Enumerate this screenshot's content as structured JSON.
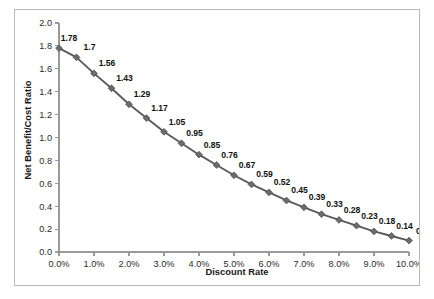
{
  "chart_data": {
    "type": "line",
    "title": "",
    "xlabel": "Discount Rate",
    "ylabel": "Net Benefit/Cost Ratio",
    "x": [
      0.0,
      0.5,
      1.0,
      1.5,
      2.0,
      2.5,
      3.0,
      3.5,
      4.0,
      4.5,
      5.0,
      5.5,
      6.0,
      6.5,
      7.0,
      7.5,
      8.0,
      8.5,
      9.0,
      9.5,
      10.0
    ],
    "values": [
      1.78,
      1.7,
      1.56,
      1.43,
      1.29,
      1.17,
      1.05,
      0.95,
      0.85,
      0.76,
      0.67,
      0.59,
      0.52,
      0.45,
      0.39,
      0.33,
      0.28,
      0.23,
      0.18,
      0.14,
      0.1
    ],
    "point_labels": [
      "1.78",
      "1.7",
      "1.56",
      "1.43",
      "1.29",
      "1.17",
      "1.05",
      "0.95",
      "0.85",
      "0.76",
      "0.67",
      "0.59",
      "0.52",
      "0.45",
      "0.39",
      "0.33",
      "0.28",
      "0.23",
      "0.18",
      "0.14",
      "0.1"
    ],
    "xlim": [
      0.0,
      10.0
    ],
    "ylim": [
      0.0,
      2.0
    ],
    "xticks": [
      0.0,
      1.0,
      2.0,
      3.0,
      4.0,
      5.0,
      6.0,
      7.0,
      8.0,
      9.0,
      10.0
    ],
    "xtick_labels": [
      "0.0%",
      "1.0%",
      "2.0%",
      "3.0%",
      "4.0%",
      "5.0%",
      "6.0%",
      "7.0%",
      "8.0%",
      "9.0%",
      "10.0%"
    ],
    "yticks": [
      0.0,
      0.2,
      0.4,
      0.6,
      0.8,
      1.0,
      1.2,
      1.4,
      1.6,
      1.8,
      2.0
    ],
    "ytick_labels": [
      "0.0",
      "0.2",
      "0.4",
      "0.6",
      "0.8",
      "1.0",
      "1.2",
      "1.4",
      "1.6",
      "1.8",
      "2.0"
    ],
    "grid": false,
    "legend": false,
    "marker": "diamond",
    "series_color": "#5a5a5a",
    "marker_color": "#6b6b6b",
    "axis_color": "#9a9a9a",
    "label_color": "#121212",
    "plot_background": "#ffffff",
    "border_color": "#b9b9b9"
  }
}
